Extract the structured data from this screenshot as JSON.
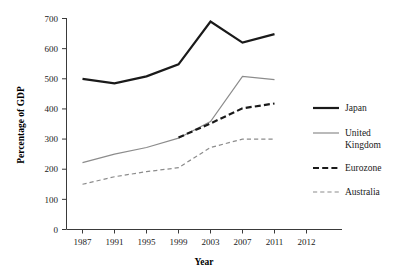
{
  "chart_data": {
    "type": "line",
    "title": "",
    "xlabel": "Year",
    "ylabel": "Percentage of GDP",
    "categories": [
      "1987",
      "1991",
      "1995",
      "1999",
      "2003",
      "2007",
      "2011",
      "2012"
    ],
    "x_tick_labels": [
      "1987",
      "1991",
      "1995",
      "1999",
      "2003",
      "2007",
      "2011",
      "2012"
    ],
    "y_tick_labels": [
      "0",
      "100",
      "200",
      "300",
      "400",
      "500",
      "600",
      "700"
    ],
    "ylim": [
      0,
      700
    ],
    "y_tick_step": 100,
    "grid": false,
    "legend_position": "right",
    "series": [
      {
        "name": "Japan",
        "style": "solid",
        "color": "#1a1a1a",
        "width": 2.2,
        "x": [
          "1987",
          "1991",
          "1995",
          "1999",
          "2003",
          "2007",
          "2011"
        ],
        "values": [
          500,
          485,
          508,
          548,
          690,
          620,
          648
        ]
      },
      {
        "name": "United Kingdom",
        "style": "solid",
        "color": "#8c8c8c",
        "width": 1.2,
        "x": [
          "1987",
          "1991",
          "1995",
          "1999",
          "2003",
          "2007",
          "2011"
        ],
        "values": [
          222,
          250,
          272,
          303,
          358,
          508,
          497
        ]
      },
      {
        "name": "Eurozone",
        "style": "dashed",
        "color": "#1a1a1a",
        "width": 2.2,
        "x": [
          "1999",
          "2003",
          "2007",
          "2011"
        ],
        "values": [
          305,
          352,
          402,
          418
        ]
      },
      {
        "name": "Australia",
        "style": "dashed",
        "color": "#8c8c8c",
        "width": 1.2,
        "x": [
          "1987",
          "1991",
          "1995",
          "1999",
          "2003",
          "2007",
          "2011"
        ],
        "values": [
          150,
          175,
          192,
          205,
          272,
          300,
          300
        ]
      }
    ]
  },
  "legend": {
    "entries": [
      {
        "label": "Japan",
        "wrapped": null
      },
      {
        "label": "United",
        "wrapped": "Kingdom"
      },
      {
        "label": "Eurozone",
        "wrapped": null
      },
      {
        "label": "Australia",
        "wrapped": null
      }
    ]
  }
}
